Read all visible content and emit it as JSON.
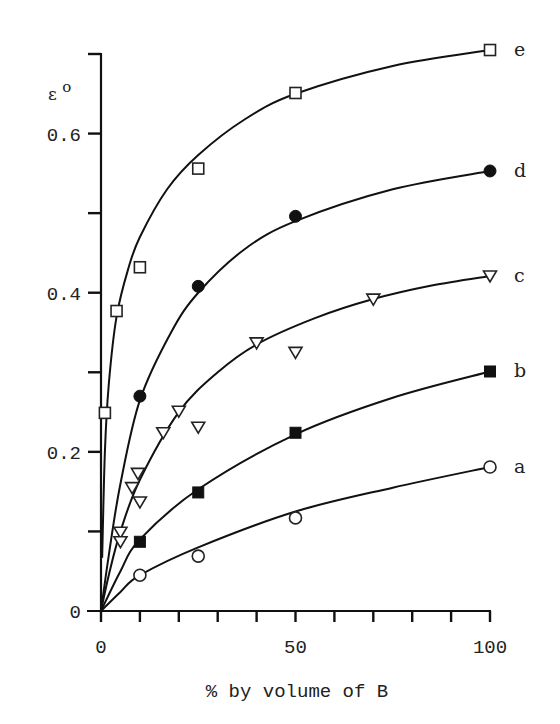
{
  "chart_data": {
    "type": "scatter",
    "title": "",
    "xlabel": "% by volume of B",
    "ylabel": "ε°",
    "ylabel_main": "ε",
    "ylabel_sup": "o",
    "xlim": [
      0,
      100
    ],
    "ylim": [
      0,
      0.7
    ],
    "grid": false,
    "x_ticks": [
      0,
      10,
      20,
      30,
      40,
      50,
      60,
      70,
      80,
      90,
      100
    ],
    "x_tick_labels": [
      {
        "value": 0,
        "label": "0"
      },
      {
        "value": 50,
        "label": "50"
      },
      {
        "value": 100,
        "label": "100"
      }
    ],
    "y_ticks": [
      0,
      0.1,
      0.2,
      0.3,
      0.4,
      0.5,
      0.6,
      0.7
    ],
    "y_tick_labels": [
      {
        "value": 0,
        "label": "0"
      },
      {
        "value": 0.2,
        "label": "0.2"
      },
      {
        "value": 0.4,
        "label": "0.4"
      },
      {
        "value": 0.6,
        "label": "0.6"
      }
    ],
    "series": [
      {
        "name": "a",
        "marker": "open-circle",
        "points": [
          [
            10,
            0.045
          ],
          [
            25,
            0.069
          ],
          [
            50,
            0.117
          ],
          [
            100,
            0.181
          ]
        ],
        "fit_curve": [
          [
            0,
            0
          ],
          [
            5,
            0.024
          ],
          [
            10,
            0.045
          ],
          [
            25,
            0.08
          ],
          [
            50,
            0.125
          ],
          [
            75,
            0.155
          ],
          [
            100,
            0.181
          ]
        ]
      },
      {
        "name": "b",
        "marker": "filled-square",
        "points": [
          [
            10,
            0.087
          ],
          [
            25,
            0.149
          ],
          [
            50,
            0.224
          ],
          [
            100,
            0.301
          ]
        ],
        "fit_curve": [
          [
            0,
            0
          ],
          [
            5,
            0.05
          ],
          [
            10,
            0.09
          ],
          [
            25,
            0.153
          ],
          [
            50,
            0.222
          ],
          [
            75,
            0.268
          ],
          [
            100,
            0.301
          ]
        ]
      },
      {
        "name": "c",
        "marker": "open-triangle-down",
        "points": [
          [
            5,
            0.099
          ],
          [
            5,
            0.087
          ],
          [
            8,
            0.155
          ],
          [
            9.5,
            0.173
          ],
          [
            10,
            0.137
          ],
          [
            16,
            0.224
          ],
          [
            20,
            0.251
          ],
          [
            25,
            0.231
          ],
          [
            40,
            0.337
          ],
          [
            50,
            0.325
          ],
          [
            70,
            0.392
          ],
          [
            100,
            0.421
          ]
        ],
        "fit_curve": [
          [
            0,
            0
          ],
          [
            2,
            0.045
          ],
          [
            5,
            0.1
          ],
          [
            10,
            0.165
          ],
          [
            20,
            0.25
          ],
          [
            30,
            0.3
          ],
          [
            40,
            0.335
          ],
          [
            55,
            0.368
          ],
          [
            70,
            0.392
          ],
          [
            85,
            0.409
          ],
          [
            100,
            0.421
          ]
        ]
      },
      {
        "name": "d",
        "marker": "filled-circle",
        "points": [
          [
            10,
            0.27
          ],
          [
            25,
            0.408
          ],
          [
            50,
            0.496
          ],
          [
            100,
            0.553
          ]
        ],
        "fit_curve": [
          [
            0,
            0
          ],
          [
            2,
            0.07
          ],
          [
            5,
            0.16
          ],
          [
            10,
            0.265
          ],
          [
            18,
            0.35
          ],
          [
            25,
            0.4
          ],
          [
            37,
            0.455
          ],
          [
            50,
            0.49
          ],
          [
            75,
            0.53
          ],
          [
            100,
            0.553
          ]
        ]
      },
      {
        "name": "e",
        "marker": "open-square",
        "points": [
          [
            1,
            0.249
          ],
          [
            4,
            0.377
          ],
          [
            10,
            0.432
          ],
          [
            25,
            0.556
          ],
          [
            50,
            0.651
          ],
          [
            100,
            0.705
          ]
        ],
        "fit_curve": [
          [
            0.3,
            0.067
          ],
          [
            1,
            0.2
          ],
          [
            2,
            0.285
          ],
          [
            4,
            0.37
          ],
          [
            7,
            0.43
          ],
          [
            10,
            0.47
          ],
          [
            17,
            0.53
          ],
          [
            25,
            0.573
          ],
          [
            37,
            0.618
          ],
          [
            50,
            0.65
          ],
          [
            75,
            0.685
          ],
          [
            100,
            0.705
          ]
        ]
      }
    ]
  }
}
